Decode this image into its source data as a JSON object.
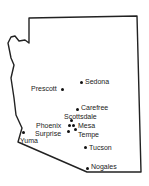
{
  "map": {
    "region": "Arizona",
    "outline_color": "#222222",
    "cities": [
      {
        "name": "Sedona",
        "dot": [
          81,
          82
        ],
        "label": [
          85,
          78
        ]
      },
      {
        "name": "Prescott",
        "dot": [
          62,
          89
        ],
        "label": [
          31,
          85
        ]
      },
      {
        "name": "Carefree",
        "dot": [
          77,
          109
        ],
        "label": [
          81,
          104
        ]
      },
      {
        "name": "Scottsdale",
        "dot": [
          71,
          120
        ],
        "label": [
          64,
          113
        ]
      },
      {
        "name": "Phoenix",
        "dot": [
          69,
          125
        ],
        "label": [
          36,
          122
        ]
      },
      {
        "name": "Mesa",
        "dot": [
          73,
          125
        ],
        "label": [
          78,
          122
        ]
      },
      {
        "name": "Surprise",
        "dot": [
          68,
          131
        ],
        "label": [
          35,
          130
        ]
      },
      {
        "name": "Tempe",
        "dot": [
          75,
          129
        ],
        "label": [
          78,
          131
        ]
      },
      {
        "name": "Yuma",
        "dot": [
          23,
          132
        ],
        "label": [
          20,
          137
        ]
      },
      {
        "name": "Tucson",
        "dot": [
          85,
          147
        ],
        "label": [
          89,
          144
        ]
      },
      {
        "name": "Nogales",
        "dot": [
          87,
          168
        ],
        "label": [
          91,
          163
        ]
      }
    ]
  }
}
